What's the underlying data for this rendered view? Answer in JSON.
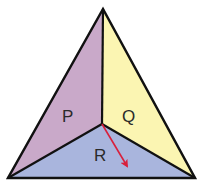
{
  "diagram": {
    "type": "triangle-partition",
    "vertices": {
      "apex": [
        103,
        9
      ],
      "bottom_left": [
        8,
        178
      ],
      "bottom_right": [
        195,
        178
      ],
      "center": [
        102,
        124
      ]
    },
    "regions": [
      {
        "id": "P",
        "label": "P",
        "color": "#c9a9c9",
        "label_pos": [
          68,
          122
        ]
      },
      {
        "id": "Q",
        "label": "Q",
        "color": "#fbf5b2",
        "label_pos": [
          129,
          122
        ]
      },
      {
        "id": "R",
        "label": "R",
        "color": "#a9b5dd",
        "label_pos": [
          100,
          161
        ]
      }
    ],
    "arrow": {
      "from": [
        102,
        124
      ],
      "to": [
        129,
        170
      ],
      "color": "#d8203c"
    },
    "edge_color": "#111111"
  }
}
